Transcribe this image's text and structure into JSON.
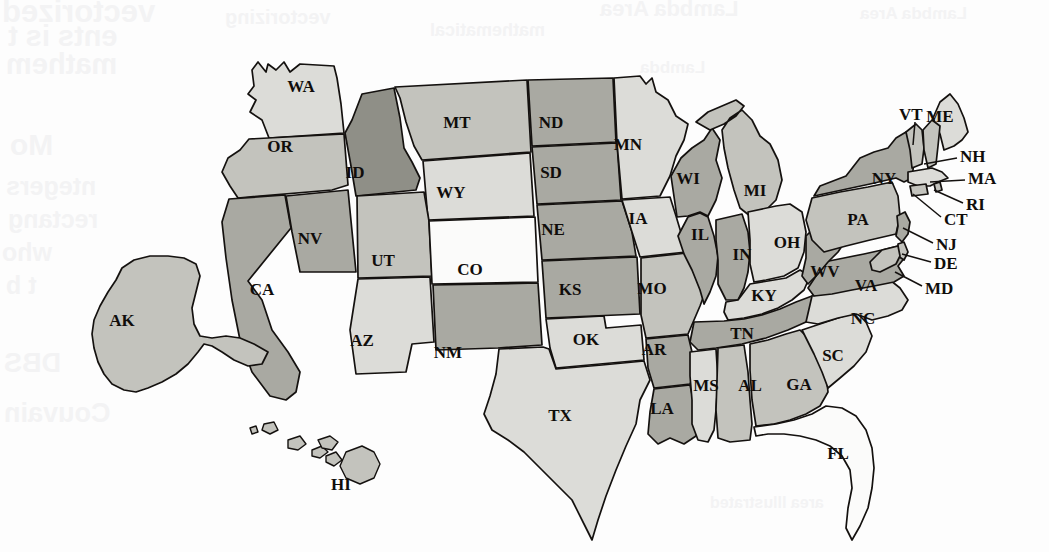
{
  "figure": {
    "kind": "choropleth-map",
    "region": "United States",
    "background_color": "#fdfdfd",
    "border_color": "#14110f"
  },
  "shading": {
    "tiers": [
      {
        "name": "lightest",
        "color": "#fbfbfa"
      },
      {
        "name": "light",
        "color": "#dcdcd8"
      },
      {
        "name": "medium",
        "color": "#c3c3bd"
      },
      {
        "name": "dark",
        "color": "#a9a9a2"
      },
      {
        "name": "darkest",
        "color": "#8f8f87"
      }
    ]
  },
  "chart_data": {
    "type": "map",
    "title": "",
    "legend": [],
    "states": [
      {
        "code": "WA",
        "tier": "light",
        "label_x": 301,
        "label_y": 88,
        "font": 17,
        "outside": false
      },
      {
        "code": "OR",
        "tier": "medium",
        "label_x": 280,
        "label_y": 148,
        "font": 17,
        "outside": false
      },
      {
        "code": "CA",
        "tier": "dark",
        "label_x": 262,
        "label_y": 291,
        "font": 17,
        "outside": false
      },
      {
        "code": "NV",
        "tier": "dark",
        "label_x": 310,
        "label_y": 240,
        "font": 17,
        "outside": false
      },
      {
        "code": "ID",
        "tier": "darkest",
        "label_x": 355,
        "label_y": 174,
        "font": 17,
        "outside": false
      },
      {
        "code": "MT",
        "tier": "medium",
        "label_x": 457,
        "label_y": 124,
        "font": 17,
        "outside": false
      },
      {
        "code": "WY",
        "tier": "light",
        "label_x": 451,
        "label_y": 194,
        "font": 17,
        "outside": false
      },
      {
        "code": "UT",
        "tier": "medium",
        "label_x": 383,
        "label_y": 262,
        "font": 17,
        "outside": false
      },
      {
        "code": "AZ",
        "tier": "light",
        "label_x": 362,
        "label_y": 342,
        "font": 17,
        "outside": false
      },
      {
        "code": "CO",
        "tier": "lightest",
        "label_x": 470,
        "label_y": 271,
        "font": 17,
        "outside": false
      },
      {
        "code": "NM",
        "tier": "dark",
        "label_x": 448,
        "label_y": 354,
        "font": 17,
        "outside": false
      },
      {
        "code": "ND",
        "tier": "dark",
        "label_x": 551,
        "label_y": 124,
        "font": 17,
        "outside": false
      },
      {
        "code": "SD",
        "tier": "dark",
        "label_x": 551,
        "label_y": 174,
        "font": 17,
        "outside": false
      },
      {
        "code": "NE",
        "tier": "dark",
        "label_x": 553,
        "label_y": 231,
        "font": 17,
        "outside": false
      },
      {
        "code": "KS",
        "tier": "dark",
        "label_x": 570,
        "label_y": 291,
        "font": 17,
        "outside": false
      },
      {
        "code": "OK",
        "tier": "light",
        "label_x": 586,
        "label_y": 341,
        "font": 17,
        "outside": false
      },
      {
        "code": "TX",
        "tier": "light",
        "label_x": 560,
        "label_y": 417,
        "font": 17,
        "outside": false
      },
      {
        "code": "MN",
        "tier": "light",
        "label_x": 628,
        "label_y": 146,
        "font": 17,
        "outside": false
      },
      {
        "code": "IA",
        "tier": "light",
        "label_x": 638,
        "label_y": 220,
        "font": 17,
        "outside": false
      },
      {
        "code": "MO",
        "tier": "medium",
        "label_x": 652,
        "label_y": 290,
        "font": 17,
        "outside": false
      },
      {
        "code": "AR",
        "tier": "dark",
        "label_x": 654,
        "label_y": 351,
        "font": 17,
        "outside": false
      },
      {
        "code": "LA",
        "tier": "dark",
        "label_x": 662,
        "label_y": 410,
        "font": 17,
        "outside": false
      },
      {
        "code": "WI",
        "tier": "dark",
        "label_x": 688,
        "label_y": 180,
        "font": 17,
        "outside": false
      },
      {
        "code": "IL",
        "tier": "dark",
        "label_x": 700,
        "label_y": 236,
        "font": 17,
        "outside": false
      },
      {
        "code": "MI",
        "tier": "medium",
        "label_x": 755,
        "label_y": 192,
        "font": 17,
        "outside": false
      },
      {
        "code": "IN",
        "tier": "dark",
        "label_x": 742,
        "label_y": 256,
        "font": 17,
        "outside": false
      },
      {
        "code": "OH",
        "tier": "light",
        "label_x": 787,
        "label_y": 244,
        "font": 17,
        "outside": false
      },
      {
        "code": "KY",
        "tier": "light",
        "label_x": 764,
        "label_y": 297,
        "font": 17,
        "outside": false
      },
      {
        "code": "TN",
        "tier": "dark",
        "label_x": 742,
        "label_y": 335,
        "font": 17,
        "outside": false
      },
      {
        "code": "MS",
        "tier": "light",
        "label_x": 706,
        "label_y": 387,
        "font": 17,
        "outside": false
      },
      {
        "code": "AL",
        "tier": "medium",
        "label_x": 750,
        "label_y": 387,
        "font": 17,
        "outside": false
      },
      {
        "code": "GA",
        "tier": "medium",
        "label_x": 799,
        "label_y": 386,
        "font": 17,
        "outside": false
      },
      {
        "code": "FL",
        "tier": "lightest",
        "label_x": 838,
        "label_y": 455,
        "font": 17,
        "outside": false
      },
      {
        "code": "SC",
        "tier": "light",
        "label_x": 833,
        "label_y": 357,
        "font": 17,
        "outside": false
      },
      {
        "code": "NC",
        "tier": "light",
        "label_x": 863,
        "label_y": 320,
        "font": 17,
        "outside": false
      },
      {
        "code": "VA",
        "tier": "dark",
        "label_x": 866,
        "label_y": 287,
        "font": 17,
        "outside": false
      },
      {
        "code": "WV",
        "tier": "dark",
        "label_x": 825,
        "label_y": 273,
        "font": 17,
        "outside": false
      },
      {
        "code": "PA",
        "tier": "medium",
        "label_x": 858,
        "label_y": 221,
        "font": 17,
        "outside": false
      },
      {
        "code": "NY",
        "tier": "dark",
        "label_x": 884,
        "label_y": 180,
        "font": 17,
        "outside": false
      },
      {
        "code": "AK",
        "tier": "medium",
        "label_x": 122,
        "label_y": 322,
        "font": 17,
        "outside": false
      },
      {
        "code": "HI",
        "tier": "medium",
        "label_x": 341,
        "label_y": 486,
        "font": 17,
        "outside": false
      },
      {
        "code": "VT",
        "tier": "medium",
        "label_x": 899,
        "label_y": 116,
        "font": 17,
        "outside": true,
        "leader": {
          "x1": 915,
          "y1": 122,
          "x2": 913,
          "y2": 145
        }
      },
      {
        "code": "ME",
        "tier": "light",
        "label_x": 940,
        "label_y": 118,
        "font": 17,
        "outside": false
      },
      {
        "code": "NH",
        "tier": "medium",
        "label_x": 960,
        "label_y": 158,
        "font": 17,
        "outside": true,
        "leader": {
          "x1": 957,
          "y1": 158,
          "x2": 924,
          "y2": 164
        }
      },
      {
        "code": "MA",
        "tier": "light",
        "label_x": 968,
        "label_y": 180,
        "font": 17,
        "outside": true,
        "leader": {
          "x1": 965,
          "y1": 180,
          "x2": 930,
          "y2": 182
        }
      },
      {
        "code": "RI",
        "tier": "medium",
        "label_x": 966,
        "label_y": 206,
        "font": 17,
        "outside": true,
        "leader": {
          "x1": 963,
          "y1": 203,
          "x2": 934,
          "y2": 190
        }
      },
      {
        "code": "CT",
        "tier": "medium",
        "label_x": 944,
        "label_y": 221,
        "font": 17,
        "outside": true,
        "leader": {
          "x1": 941,
          "y1": 217,
          "x2": 913,
          "y2": 194
        }
      },
      {
        "code": "NJ",
        "tier": "dark",
        "label_x": 936,
        "label_y": 246,
        "font": 17,
        "outside": true,
        "leader": {
          "x1": 933,
          "y1": 243,
          "x2": 903,
          "y2": 228
        }
      },
      {
        "code": "DE",
        "tier": "medium",
        "label_x": 934,
        "label_y": 265,
        "font": 17,
        "outside": true,
        "leader": {
          "x1": 931,
          "y1": 262,
          "x2": 902,
          "y2": 254
        }
      },
      {
        "code": "MD",
        "tier": "medium",
        "label_x": 925,
        "label_y": 290,
        "font": 17,
        "outside": true,
        "leader": {
          "x1": 922,
          "y1": 286,
          "x2": 895,
          "y2": 272
        }
      }
    ]
  },
  "bleed_text": {
    "lines": [
      "vectorized",
      "ents is t",
      "mathem",
      "Mo",
      "ntegers",
      "rectang",
      "who",
      "t b",
      "DBS",
      "Couvain",
      "Lambda Area",
      "vectorizing",
      "mathematical",
      "Lambda",
      "area Illustrated",
      "Lambda Area"
    ]
  }
}
